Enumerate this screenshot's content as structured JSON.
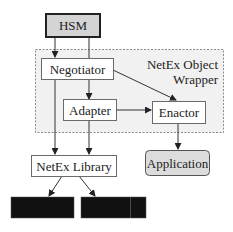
{
  "diagram": {
    "colors": {
      "line": "#333333",
      "box_fill": "#ffffff",
      "box_stroke": "#6a6a6a",
      "hsm_fill": "#d4d4d4",
      "hsm_stroke": "#222222",
      "wrapper_fill": "#f1f1f1",
      "wrapper_stroke": "#8a8a8a",
      "app_fill": "#dcdcdc",
      "black_box": "#111111"
    },
    "nodes": {
      "hsm": {
        "label": "HSM"
      },
      "wrapper": {
        "label_line1": "NetEx Object",
        "label_line2": "Wrapper"
      },
      "negotiator": {
        "label": "Negotiator"
      },
      "adapter": {
        "label": "Adapter"
      },
      "enactor": {
        "label": "Enactor"
      },
      "netex_library": {
        "label": "NetEx Library"
      },
      "application": {
        "label": "Application"
      },
      "redacted_1": {
        "label": ""
      },
      "redacted_2": {
        "label": ""
      }
    },
    "edges": [
      {
        "from": "HSM",
        "to": "Negotiator"
      },
      {
        "from": "HSM",
        "to": "Adapter"
      },
      {
        "from": "Negotiator",
        "to": "Enactor"
      },
      {
        "from": "Negotiator",
        "to": "NetEx Library"
      },
      {
        "from": "Adapter",
        "to": "Enactor"
      },
      {
        "from": "Adapter",
        "to": "NetEx Library"
      },
      {
        "from": "Enactor",
        "to": "Application"
      },
      {
        "from": "NetEx Library",
        "to": "redacted_1"
      },
      {
        "from": "NetEx Library",
        "to": "redacted_2"
      }
    ]
  }
}
